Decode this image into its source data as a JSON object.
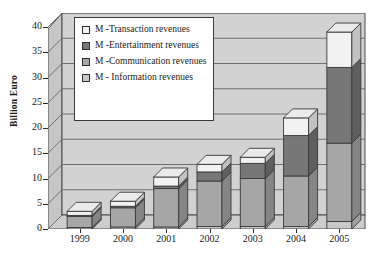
{
  "chart_data": {
    "type": "bar",
    "subtype": "stacked-column-3d",
    "title": "",
    "xlabel": "",
    "ylabel": "Billion Euro",
    "categories": [
      "1999",
      "2000",
      "2001",
      "2002",
      "2003",
      "2004",
      "2005"
    ],
    "ylim": [
      0,
      40
    ],
    "yticks": [
      0,
      5,
      10,
      15,
      20,
      25,
      30,
      35,
      40
    ],
    "grid": true,
    "legend_position": "upper-left-inside",
    "series": [
      {
        "name": "M - Information revenues",
        "color": "#c9c9c9",
        "values": [
          0.3,
          0.4,
          0.4,
          0.5,
          0.5,
          0.5,
          1.5
        ]
      },
      {
        "name": "M -Communication revenues",
        "color": "#a6a6a6",
        "values": [
          2.2,
          3.8,
          7.6,
          9.0,
          9.5,
          10.0,
          15.5
        ]
      },
      {
        "name": "M -Entertainment revenues",
        "color": "#777777",
        "values": [
          0.2,
          0.3,
          0.5,
          1.8,
          3.0,
          8.0,
          15.0
        ]
      },
      {
        "name": "M -Transaction revenues",
        "color": "#f2f2f2",
        "values": [
          0.8,
          1.0,
          1.8,
          1.5,
          1.2,
          3.5,
          7.0
        ]
      }
    ],
    "totals": [
      3.5,
      5.5,
      10.3,
      12.8,
      14.2,
      22.0,
      39.0
    ]
  },
  "legend": {
    "items": [
      {
        "label": "M -Transaction revenues",
        "swatch": "#f2f2f2"
      },
      {
        "label": "M -Entertainment revenues",
        "swatch": "#777777"
      },
      {
        "label": "M -Communication revenues",
        "swatch": "#a6a6a6"
      },
      {
        "label": "M - Information revenues",
        "swatch": "#c9c9c9"
      }
    ]
  },
  "axis": {
    "y_title": "Billion Euro",
    "y_tick_labels": [
      "40",
      "35",
      "30",
      "25",
      "20",
      "15",
      "10",
      "5",
      "0"
    ],
    "x_tick_labels": [
      "1999",
      "2000",
      "2001",
      "2002",
      "2003",
      "2004",
      "2005"
    ]
  },
  "colors": {
    "plot_background": "#d2d2d2",
    "page_background": "#ffffff",
    "axis_line": "#2a2a2a",
    "grid_line": "#6f6f6f"
  }
}
